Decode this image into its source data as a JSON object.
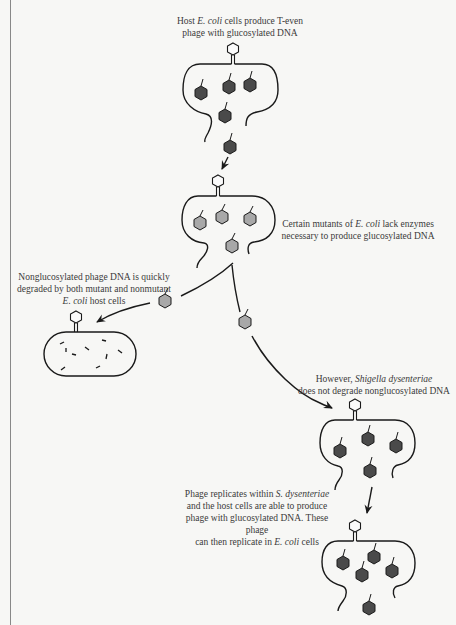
{
  "captions": {
    "top": {
      "pre": "Host ",
      "italic": "E. coli",
      "post": " cells produce T-even",
      "line2": "phage with glucosylated DNA"
    },
    "mutants": {
      "pre": "Certain mutants of ",
      "italic": "E. coli",
      "post": " lack enzymes",
      "line2": "necessary to produce glucosylated DNA"
    },
    "degraded": {
      "line1": "Nonglucosylated phage DNA is quickly",
      "line2": "degraded by both mutant and nonmutant",
      "italic": "E. coli",
      "post": " host cells"
    },
    "shigella": {
      "pre": "However, ",
      "italic": "Shigella dysenteriae",
      "line2": "does not degrade nonglucosylated DNA"
    },
    "replicates": {
      "pre": "Phage replicates within ",
      "italic": "S. dysenteriae",
      "line2": "and the host cells are able to produce",
      "line3": "phage with glucosylated DNA. These phage",
      "line4pre": "can then replicate in ",
      "line4italic": "E. coli",
      "line4post": " cells"
    }
  },
  "colors": {
    "glucosylated_phage": "#4a4a4a",
    "nonglucosylated_phage": "#a8a8a8",
    "stroke": "#1a1a1a",
    "background": "#f7f7f5"
  },
  "diagram": {
    "cells": [
      {
        "id": "host-ecoli",
        "phage_type": "glucosylated",
        "state": "lysing"
      },
      {
        "id": "mutant-ecoli",
        "phage_type": "nonglucosylated",
        "state": "lysing"
      },
      {
        "id": "ecoli-degrading",
        "phage_type": "degraded-fragments",
        "state": "intact"
      },
      {
        "id": "shigella",
        "phage_type": "glucosylated",
        "state": "lysing"
      },
      {
        "id": "ecoli-final",
        "phage_type": "glucosylated",
        "state": "lysing"
      }
    ]
  }
}
